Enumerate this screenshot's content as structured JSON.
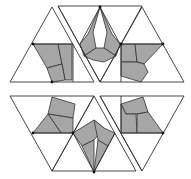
{
  "figure": {
    "colors": {
      "line": "#333333",
      "shade": "#a6a6a6",
      "background": "#ffffff",
      "dot": "#111111"
    },
    "outlines": [
      {
        "name": "top-left-triangle",
        "points": "10,82 52,7 94,82"
      },
      {
        "name": "top-middle-trapezoid",
        "points": "58,6 142,6 100,82"
      },
      {
        "name": "top-right-triangle",
        "points": "100,82 142,7 184,82"
      },
      {
        "name": "bottom-left-trapezoid",
        "points": "10,96 94,96 52,171"
      },
      {
        "name": "bottom-middle-triangle",
        "points": "52,171 94,96 136,171"
      },
      {
        "name": "bottom-right-triangle",
        "points": "100,96 184,96 142,171"
      }
    ],
    "lines": [
      {
        "name": "top-left-gap",
        "d": "M58,6 L100,82"
      },
      {
        "name": "top-inner-left",
        "d": "M33,44 L73,44 L73,82"
      },
      {
        "name": "top-inner-mid",
        "d": "M80,44 L100,7 L120,44"
      },
      {
        "name": "top-inner-right",
        "d": "M121,44 L163,44"
      },
      {
        "name": "top-right-vert",
        "d": "M121,44 L121,82"
      },
      {
        "name": "bottom-inner-left",
        "d": "M33,133 L73,133"
      },
      {
        "name": "bottom-inner-right",
        "d": "M121,96 L121,133 L163,133"
      },
      {
        "name": "bottom-gap",
        "d": "M100,96 L142,171"
      },
      {
        "name": "bottom-mid-lines",
        "d": "M73,133 L94,172 L115,133"
      }
    ],
    "shaded": [
      {
        "name": "top-left-shape-a",
        "points": "33,44 58,44 62,64 47,68"
      },
      {
        "name": "top-left-shape-b",
        "points": "58,44 72,44 72,80 65,80 62,64"
      },
      {
        "name": "top-left-shape-c",
        "points": "47,68 62,64 65,80 52,82"
      },
      {
        "name": "top-mid-shape-a",
        "points": "100,7 88,34 80,44 84,56 96,48 93,32"
      },
      {
        "name": "top-mid-shape-b",
        "points": "100,7 107,32 104,48 116,56 120,44 112,34"
      },
      {
        "name": "top-mid-shape-c",
        "points": "84,56 96,48 104,48 116,56 104,62 93,60"
      },
      {
        "name": "top-right-shape-a",
        "points": "121,44 135,44 137,62 121,62"
      },
      {
        "name": "top-right-shape-b",
        "points": "135,44 163,44 144,64 137,62"
      },
      {
        "name": "top-right-shape-c",
        "points": "121,62 137,62 144,64 148,72 141,82 121,76"
      },
      {
        "name": "bottom-left-shape-a",
        "points": "52,97 75,104 73,118 48,114"
      },
      {
        "name": "bottom-left-shape-b",
        "points": "48,114 73,118 73,133 61,133"
      },
      {
        "name": "bottom-left-shape-c",
        "points": "33,133 48,114 61,133"
      },
      {
        "name": "bottom-mid-shape-a",
        "points": "73,133 94,120 104,128 94,140 82,146"
      },
      {
        "name": "bottom-mid-shape-b",
        "points": "94,120 104,128 115,133 108,146 98,140"
      },
      {
        "name": "bottom-mid-shape-c",
        "points": "82,146 94,140 94,172"
      },
      {
        "name": "bottom-mid-shape-d",
        "points": "98,140 108,146 94,172"
      },
      {
        "name": "bottom-right-shape-a",
        "points": "121,104 143,97 148,112 137,114 126,114"
      },
      {
        "name": "bottom-right-shape-b",
        "points": "121,104 126,114 136,114 137,133 121,133"
      },
      {
        "name": "bottom-right-shape-c",
        "points": "137,114 148,112 163,133 137,133"
      }
    ],
    "dots": [
      {
        "name": "dot-1",
        "cx": 33,
        "cy": 44
      },
      {
        "name": "dot-2",
        "cx": 52,
        "cy": 82
      },
      {
        "name": "dot-3",
        "cx": 100,
        "cy": 7
      },
      {
        "name": "dot-4",
        "cx": 121,
        "cy": 44
      },
      {
        "name": "dot-5",
        "cx": 163,
        "cy": 44
      },
      {
        "name": "dot-6",
        "cx": 33,
        "cy": 133
      },
      {
        "name": "dot-7",
        "cx": 73,
        "cy": 133
      },
      {
        "name": "dot-8",
        "cx": 94,
        "cy": 172
      },
      {
        "name": "dot-9",
        "cx": 163,
        "cy": 133
      }
    ]
  }
}
